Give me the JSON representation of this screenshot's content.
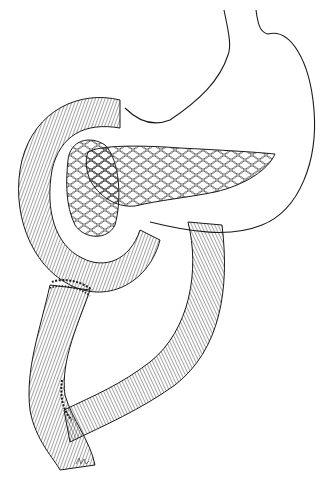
{
  "figure": {
    "title": "Anatomical illustration: stomach, pancreas, and Roux-en-Y intestinal loop with anastomoses",
    "style": "black ink line drawing on white background",
    "colors": {
      "background": "#ffffff",
      "ink": "#1a1a1a"
    },
    "elements": [
      {
        "name": "stomach",
        "description": "outline of stomach at top right"
      },
      {
        "name": "pancreas",
        "description": "lobulated pancreas body and tail across middle"
      },
      {
        "name": "pancreatic-head",
        "description": "lobulated pancreatic head inside duodenal C-loop"
      },
      {
        "name": "duodenum",
        "description": "hatched C-shaped intestinal loop on left"
      },
      {
        "name": "jejunal-limb",
        "description": "hatched intestinal limb looping down on right"
      },
      {
        "name": "anastomosis-upper",
        "description": "sutured junction on left loop"
      },
      {
        "name": "anastomosis-lower",
        "description": "sutured side-to-end junction lower left"
      },
      {
        "name": "artist-signature",
        "description": "small illegible artist mark at bottom"
      }
    ]
  }
}
